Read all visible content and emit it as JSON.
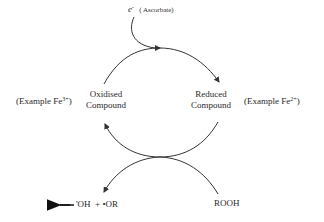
{
  "electron_donor": {
    "symbol": "e",
    "charge": "-",
    "label": "( Ascorbate)"
  },
  "left_node": {
    "example_prefix": "(Example Fe",
    "example_charge": "3+",
    "example_suffix": ")",
    "line1": "Oxidised",
    "line2": "Compound"
  },
  "right_node": {
    "line1": "Reduced",
    "line2": "Compound",
    "example_prefix": "(Example Fe",
    "example_charge": "2+",
    "example_suffix": ")"
  },
  "reactant": {
    "label": "ROOH"
  },
  "products": {
    "label": "'OH  + •OR"
  },
  "colors": {
    "line": "#333333",
    "text": "#2a2a2a",
    "background": "#ffffff"
  }
}
